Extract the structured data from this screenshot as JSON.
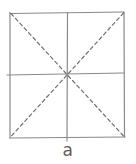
{
  "figure": {
    "label": "a",
    "canvas": {
      "width": 136,
      "height": 164
    },
    "square": {
      "x": 10,
      "y": 12,
      "width": 114,
      "height": 125
    },
    "solid_lines": [
      {
        "name": "square-top-edge",
        "x1": 10,
        "y1": 13.5,
        "x2": 124,
        "y2": 12
      },
      {
        "name": "square-right-edge",
        "x1": 124,
        "y1": 12,
        "x2": 124.5,
        "y2": 137
      },
      {
        "name": "square-bottom-edge",
        "x1": 9.5,
        "y1": 138,
        "x2": 125,
        "y2": 137
      },
      {
        "name": "square-left-edge",
        "x1": 10,
        "y1": 12.5,
        "x2": 10,
        "y2": 137.5
      },
      {
        "name": "vertical-midline",
        "x1": 67.5,
        "y1": 12.5,
        "x2": 67,
        "y2": 141
      },
      {
        "name": "horizontal-midline",
        "x1": 7,
        "y1": 75,
        "x2": 124,
        "y2": 73
      }
    ],
    "dashed_lines": [
      {
        "name": "diagonal-tl-br",
        "x1": 11,
        "y1": 13.5,
        "x2": 124,
        "y2": 136.5
      },
      {
        "name": "diagonal-tr-bl",
        "x1": 123.5,
        "y1": 13,
        "x2": 10.5,
        "y2": 137
      }
    ],
    "style": {
      "solid_color": "#8a8a8a",
      "dashed_color": "#6f6f6f",
      "label_color": "#5f5f5f",
      "background": "#ffffff",
      "stroke_width": 1.2,
      "dash_pattern": "3.5 3"
    }
  }
}
